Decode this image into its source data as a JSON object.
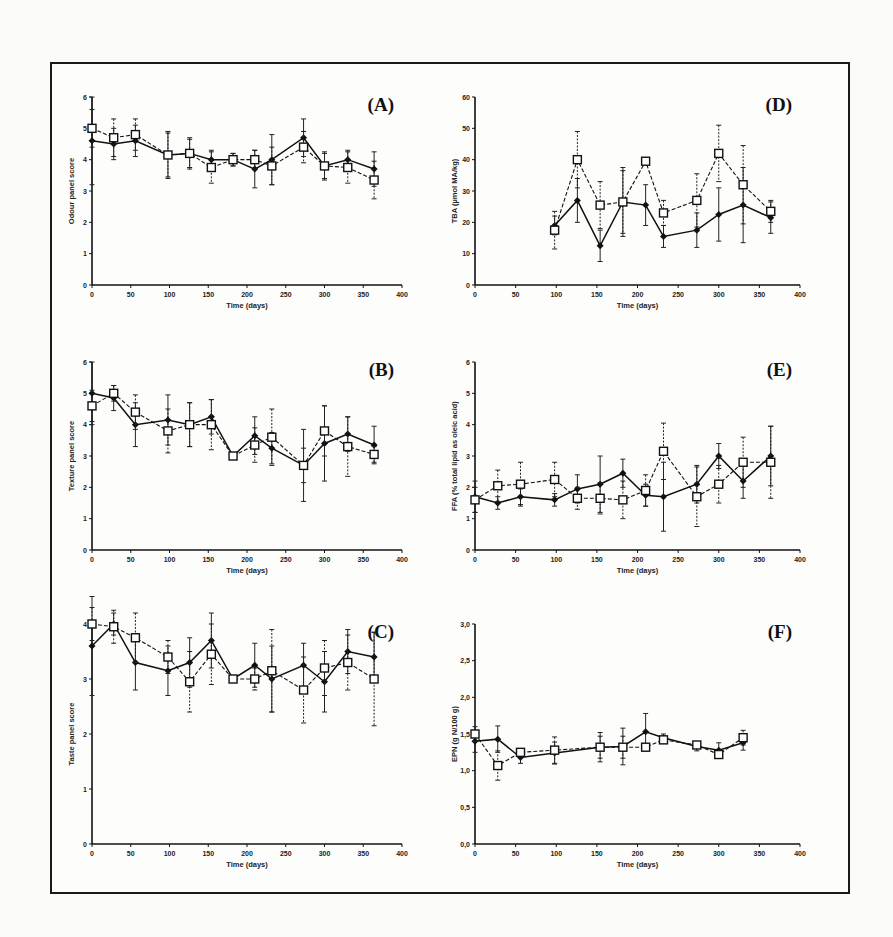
{
  "figure": {
    "frame": true
  },
  "chart_data": [
    {
      "id": "A",
      "type": "line",
      "panel_label": "(A)",
      "xlabel": "Time (days)",
      "ylabel": "Odour panel score",
      "xlim": [
        0,
        400
      ],
      "ylim": [
        0,
        6
      ],
      "xticks": [
        0,
        50,
        100,
        150,
        200,
        250,
        300,
        350,
        400
      ],
      "yticks": [
        0,
        1,
        2,
        3,
        4,
        5,
        6
      ],
      "series": [
        {
          "name": "filled-diamond",
          "marker": "diamond-filled",
          "line": "solid",
          "x": [
            0,
            28,
            56,
            98,
            126,
            154,
            182,
            210,
            232,
            273,
            300,
            330,
            364
          ],
          "y": [
            4.6,
            4.5,
            4.6,
            4.15,
            4.2,
            4.0,
            4.0,
            3.7,
            4.0,
            4.7,
            3.8,
            4.0,
            3.7
          ],
          "err": [
            1.4,
            0.5,
            0.5,
            0.75,
            0.5,
            0.3,
            0.2,
            0.6,
            0.8,
            0.6,
            0.45,
            0.3,
            0.55
          ]
        },
        {
          "name": "open-square",
          "marker": "square-open",
          "line": "dashed",
          "x": [
            0,
            28,
            56,
            98,
            126,
            154,
            182,
            210,
            232,
            273,
            300,
            330,
            364
          ],
          "y": [
            5.0,
            4.7,
            4.8,
            4.15,
            4.2,
            3.75,
            4.0,
            4.0,
            3.8,
            4.4,
            3.8,
            3.75,
            3.35
          ],
          "err": [
            0.6,
            0.6,
            0.5,
            0.7,
            0.45,
            0.5,
            0.2,
            0.3,
            0.6,
            0.5,
            0.4,
            0.5,
            0.6
          ]
        }
      ]
    },
    {
      "id": "D",
      "type": "line",
      "panel_label": "(D)",
      "xlabel": "Time (days)",
      "ylabel": "TBA (µmol MA/kg)",
      "xlim": [
        0,
        400
      ],
      "ylim": [
        0,
        60
      ],
      "xticks": [
        0,
        50,
        100,
        150,
        200,
        250,
        300,
        350,
        400
      ],
      "yticks": [
        0,
        10,
        20,
        30,
        40,
        50,
        60
      ],
      "series": [
        {
          "name": "filled-diamond",
          "marker": "diamond-filled",
          "line": "solid",
          "x": [
            98,
            126,
            154,
            182,
            210,
            232,
            273,
            300,
            330,
            364
          ],
          "y": [
            19,
            27,
            12.5,
            26.5,
            25.5,
            15.5,
            17.5,
            22.5,
            25.5,
            21.5
          ],
          "err": [
            3,
            7,
            5,
            11,
            6.5,
            3.5,
            5.5,
            8.5,
            12,
            5
          ]
        },
        {
          "name": "open-square",
          "marker": "square-open",
          "line": "dashed",
          "x": [
            98,
            126,
            154,
            182,
            210,
            232,
            273,
            300,
            330,
            364
          ],
          "y": [
            17.5,
            40,
            25.5,
            26.5,
            39.5,
            23,
            27,
            42,
            32,
            23.5
          ],
          "err": [
            6,
            9,
            7.5,
            10,
            1,
            4,
            8.5,
            9,
            12.5,
            3.5
          ]
        }
      ]
    },
    {
      "id": "B",
      "type": "line",
      "panel_label": "(B)",
      "xlabel": "Time (days)",
      "ylabel": "Texture panel score",
      "xlim": [
        0,
        400
      ],
      "ylim": [
        0,
        6
      ],
      "xticks": [
        0,
        50,
        100,
        150,
        200,
        250,
        300,
        350,
        400
      ],
      "yticks": [
        0,
        1,
        2,
        3,
        4,
        5,
        6
      ],
      "series": [
        {
          "name": "filled-diamond",
          "marker": "diamond-filled",
          "line": "solid",
          "x": [
            0,
            28,
            56,
            98,
            126,
            154,
            182,
            210,
            232,
            273,
            300,
            330,
            364
          ],
          "y": [
            5.0,
            4.85,
            4.0,
            4.15,
            4.0,
            4.25,
            3.0,
            3.65,
            3.25,
            2.7,
            3.4,
            3.7,
            3.35
          ],
          "err": [
            1.0,
            0.4,
            0.7,
            0.8,
            0.7,
            0.55,
            0.1,
            0.6,
            0.5,
            1.15,
            1.2,
            0.55,
            0.6
          ]
        },
        {
          "name": "open-square",
          "marker": "square-open",
          "line": "dashed",
          "x": [
            0,
            28,
            56,
            98,
            126,
            154,
            182,
            210,
            232,
            273,
            300,
            330,
            364
          ],
          "y": [
            4.6,
            5.0,
            4.4,
            3.8,
            4.0,
            4.0,
            3.0,
            3.35,
            3.6,
            2.7,
            3.8,
            3.3,
            3.05
          ],
          "err": [
            0.5,
            0.25,
            0.55,
            0.7,
            0.7,
            0.8,
            0.1,
            0.55,
            0.9,
            0.55,
            0.8,
            0.95,
            0.25
          ]
        }
      ]
    },
    {
      "id": "E",
      "type": "line",
      "panel_label": "(E)",
      "xlabel": "Time (days)",
      "ylabel": "FFA (% total lipid as oleic acid)",
      "xlim": [
        0,
        400
      ],
      "ylim": [
        0,
        6
      ],
      "xticks": [
        0,
        50,
        100,
        150,
        200,
        250,
        300,
        350,
        400
      ],
      "yticks": [
        0,
        1,
        2,
        3,
        4,
        5,
        6
      ],
      "series": [
        {
          "name": "filled-diamond",
          "marker": "diamond-filled",
          "line": "solid",
          "x": [
            0,
            28,
            56,
            98,
            126,
            154,
            182,
            210,
            232,
            273,
            300,
            330,
            364
          ],
          "y": [
            1.7,
            1.5,
            1.7,
            1.6,
            1.95,
            2.1,
            2.45,
            1.75,
            1.7,
            2.1,
            3.0,
            2.2,
            3.0
          ],
          "err": [
            0.5,
            0.2,
            0.25,
            0.2,
            0.45,
            0.9,
            0.45,
            0.35,
            1.1,
            0.6,
            0.4,
            0.55,
            0.95
          ]
        },
        {
          "name": "open-square",
          "marker": "square-open",
          "line": "dashed",
          "x": [
            0,
            28,
            56,
            98,
            126,
            154,
            182,
            210,
            232,
            273,
            300,
            330,
            364
          ],
          "y": [
            1.6,
            2.05,
            2.1,
            2.25,
            1.65,
            1.65,
            1.6,
            1.9,
            3.15,
            1.7,
            2.1,
            2.8,
            2.8
          ],
          "err": [
            0.4,
            0.5,
            0.7,
            0.55,
            0.35,
            0.5,
            0.6,
            0.5,
            0.9,
            0.95,
            0.6,
            0.8,
            1.15
          ]
        }
      ]
    },
    {
      "id": "C",
      "type": "line",
      "panel_label": "(C)",
      "xlabel": "Time (days)",
      "ylabel": "Taste panel score",
      "xlim": [
        0,
        400
      ],
      "ylim": [
        0,
        4
      ],
      "xticks": [
        0,
        50,
        100,
        150,
        200,
        250,
        300,
        350,
        400
      ],
      "yticks": [
        0,
        1,
        2,
        3,
        4
      ],
      "series": [
        {
          "name": "filled-diamond",
          "marker": "diamond-filled",
          "line": "solid",
          "x": [
            0,
            28,
            56,
            98,
            126,
            154,
            182,
            210,
            232,
            273,
            300,
            330,
            364
          ],
          "y": [
            3.6,
            4.0,
            3.3,
            3.15,
            3.3,
            3.7,
            3.0,
            3.25,
            3.0,
            3.25,
            2.95,
            3.5,
            3.4
          ],
          "err": [
            0.9,
            0.2,
            0.5,
            0.45,
            0.45,
            0.5,
            0.05,
            0.4,
            0.6,
            0.4,
            0.55,
            0.4,
            0.45
          ]
        },
        {
          "name": "open-square",
          "marker": "square-open",
          "line": "dashed",
          "x": [
            0,
            28,
            56,
            98,
            126,
            154,
            182,
            210,
            232,
            273,
            300,
            330,
            364
          ],
          "y": [
            4.0,
            3.95,
            3.75,
            3.4,
            2.95,
            3.45,
            3.0,
            3.0,
            3.15,
            2.8,
            3.2,
            3.3,
            3.0
          ],
          "err": [
            0.3,
            0.3,
            0.45,
            0.3,
            0.55,
            0.55,
            0.05,
            0.2,
            0.75,
            0.6,
            0.5,
            0.5,
            0.85
          ]
        }
      ]
    },
    {
      "id": "F",
      "type": "line",
      "panel_label": "(F)",
      "xlabel": "Time (days)",
      "ylabel": "EPN (g N/100 g)",
      "xlim": [
        0,
        400
      ],
      "ylim": [
        0,
        3
      ],
      "xticks": [
        0,
        50,
        100,
        150,
        200,
        250,
        300,
        350,
        400
      ],
      "yticks": [
        0,
        0.5,
        1.0,
        1.5,
        2.0,
        2.5,
        3.0
      ],
      "ytick_labels": [
        "0,0",
        "0,5",
        "1,0",
        "1,5",
        "2,0",
        "2,5",
        "3,0"
      ],
      "series": [
        {
          "name": "filled-diamond",
          "marker": "diamond-filled",
          "line": "solid",
          "x": [
            0,
            28,
            56,
            98,
            154,
            182,
            210,
            232,
            273,
            300,
            330
          ],
          "y": [
            1.4,
            1.43,
            1.18,
            1.24,
            1.32,
            1.33,
            1.53,
            1.45,
            1.33,
            1.28,
            1.38
          ],
          "err": [
            0.15,
            0.18,
            0.08,
            0.15,
            0.2,
            0.25,
            0.25,
            0.05,
            0.06,
            0.1,
            0.1
          ]
        },
        {
          "name": "open-square",
          "marker": "square-open",
          "line": "dashed",
          "x": [
            0,
            28,
            56,
            98,
            154,
            182,
            210,
            232,
            273,
            300,
            330
          ],
          "y": [
            1.5,
            1.07,
            1.25,
            1.28,
            1.32,
            1.32,
            1.32,
            1.42,
            1.35,
            1.22,
            1.45
          ],
          "err": [
            0.1,
            0.2,
            0.05,
            0.18,
            0.15,
            0.15,
            0.05,
            0.05,
            0.04,
            0.05,
            0.1
          ]
        }
      ]
    }
  ]
}
